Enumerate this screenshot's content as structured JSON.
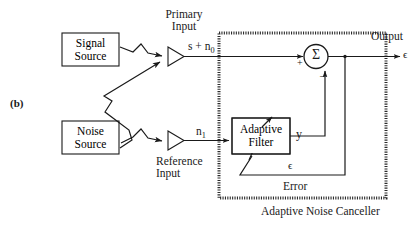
{
  "figure": {
    "panel_label": "(b)",
    "caption": "Adaptive Noise Canceller"
  },
  "blocks": {
    "signal_source": {
      "line1": "Signal",
      "line2": "Source"
    },
    "noise_source": {
      "line1": "Noise",
      "line2": "Source"
    },
    "adaptive_filter": {
      "line1": "Adaptive",
      "line2": "Filter"
    }
  },
  "sensors": {
    "primary": {
      "label_line1": "Primary",
      "label_line2": "Input"
    },
    "reference": {
      "label_line1": "Reference",
      "label_line2": "Input"
    }
  },
  "signals": {
    "primary_signal_base": "s + n",
    "primary_signal_sub": "0",
    "reference_signal_base": "n",
    "reference_signal_sub": "1",
    "filter_output": "y",
    "error_symbol": "ϵ",
    "error_label": "Error",
    "output_label": "Output",
    "output_symbol": "ϵ"
  },
  "summer": {
    "symbol": "Σ",
    "plus_sign": "+",
    "minus_sign": "–"
  },
  "colors": {
    "line": "#1a1a1a",
    "text": "#1a1a1a",
    "background": "#ffffff",
    "dotted_border": "#333333"
  }
}
